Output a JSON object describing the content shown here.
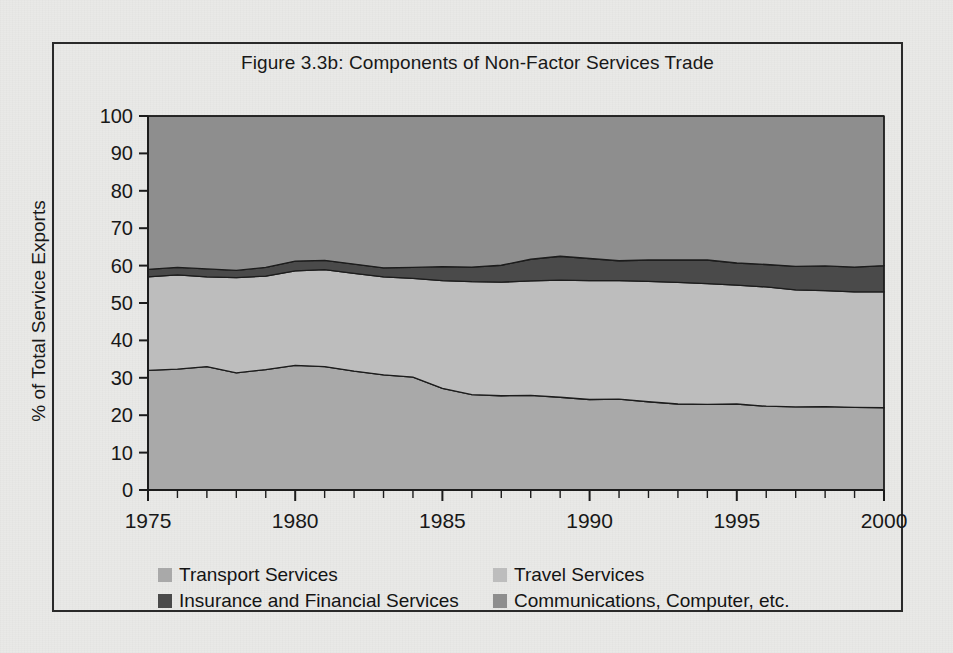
{
  "figure": {
    "title": "Figure 3.3b: Components of Non-Factor Services Trade"
  },
  "axes": {
    "ylabel": "% of Total Service Exports",
    "yticks": [
      "100",
      "90",
      "80",
      "70",
      "60",
      "50",
      "40",
      "30",
      "20",
      "10",
      "0"
    ],
    "xticks": [
      "1975",
      "1980",
      "1985",
      "1990",
      "1995",
      "2000"
    ]
  },
  "legend": {
    "items": [
      {
        "label": "Transport Services",
        "color": "#a9a9a9"
      },
      {
        "label": "Travel Services",
        "color": "#bdbdbd"
      },
      {
        "label": "Insurance and Financial Services",
        "color": "#4a4a4a"
      },
      {
        "label": "Communications, Computer, etc.",
        "color": "#8e8e8e"
      }
    ]
  },
  "chart_data": {
    "type": "area",
    "stacked": true,
    "normalized_to": 100,
    "title": "Figure 3.3b: Components of Non-Factor Services Trade",
    "xlabel": "",
    "ylabel": "% of Total Service Exports",
    "xlim": [
      1975,
      2000
    ],
    "ylim": [
      0,
      100
    ],
    "grid": false,
    "legend_position": "bottom",
    "x": [
      1975,
      1976,
      1977,
      1978,
      1979,
      1980,
      1981,
      1982,
      1983,
      1984,
      1985,
      1986,
      1987,
      1988,
      1989,
      1990,
      1991,
      1992,
      1993,
      1994,
      1995,
      1996,
      1997,
      1998,
      1999,
      2000
    ],
    "series": [
      {
        "name": "Transport Services",
        "color": "#a9a9a9",
        "values": [
          32.0,
          32.3,
          33.0,
          31.3,
          32.2,
          33.3,
          33.0,
          31.8,
          30.8,
          30.2,
          27.2,
          25.5,
          25.2,
          25.3,
          24.8,
          24.2,
          24.3,
          23.6,
          23.0,
          22.9,
          23.0,
          22.4,
          22.2,
          22.3,
          22.1,
          22.0
        ]
      },
      {
        "name": "Travel Services",
        "color": "#bdbdbd",
        "values": [
          25.0,
          25.2,
          24.0,
          25.5,
          25.0,
          25.3,
          25.9,
          26.1,
          26.2,
          26.4,
          28.8,
          30.2,
          30.4,
          30.6,
          31.3,
          31.8,
          31.7,
          32.2,
          32.5,
          32.3,
          31.8,
          31.9,
          31.3,
          31.0,
          30.9,
          31.0
        ]
      },
      {
        "name": "Insurance and Financial Services",
        "color": "#4a4a4a",
        "values": [
          2.0,
          2.0,
          2.1,
          1.9,
          2.3,
          2.6,
          2.5,
          2.5,
          2.4,
          2.9,
          3.7,
          3.9,
          4.5,
          5.8,
          6.4,
          5.9,
          5.3,
          5.7,
          6.0,
          6.3,
          5.9,
          6.0,
          6.3,
          6.6,
          6.6,
          7.0
        ]
      },
      {
        "name": "Communications, Computer, etc.",
        "color": "#8e8e8e",
        "values": [
          41.0,
          40.5,
          40.9,
          41.3,
          40.5,
          38.8,
          38.6,
          39.6,
          40.6,
          40.5,
          40.3,
          40.4,
          39.9,
          38.3,
          37.5,
          38.1,
          38.7,
          38.5,
          38.5,
          38.5,
          39.3,
          39.7,
          40.2,
          40.1,
          40.4,
          40.0
        ]
      }
    ]
  },
  "geometry": {
    "plot_left": 148,
    "plot_right": 884,
    "plot_top": 116,
    "plot_bottom": 490
  }
}
